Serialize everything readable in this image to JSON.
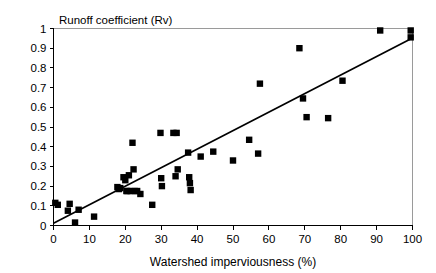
{
  "chart_data": {
    "type": "scatter",
    "title": "",
    "xlabel": "Watershed imperviousness (%)",
    "ylabel": "Runoff coefficient (Rv)",
    "xlim": [
      0,
      100
    ],
    "ylim": [
      0,
      1
    ],
    "xticks": [
      0,
      10,
      20,
      30,
      40,
      50,
      60,
      70,
      80,
      90,
      100
    ],
    "xtick_labels": [
      "0",
      "10",
      "20",
      "30",
      "40",
      "50",
      "60",
      "70",
      "80",
      "90",
      "100"
    ],
    "yticks": [
      0,
      0.1,
      0.2,
      0.3,
      0.4,
      0.5,
      0.6,
      0.7,
      0.8,
      0.9,
      1
    ],
    "ytick_labels": [
      "0",
      "0.1",
      "0.2",
      "0.3",
      "0.4",
      "0.5",
      "0.6",
      "0.7",
      "0.8",
      "0.9",
      "1"
    ],
    "grid": false,
    "legend": null,
    "marker": "square",
    "marker_color": "#000000",
    "points": [
      [
        0.5,
        0.115
      ],
      [
        1.2,
        0.105
      ],
      [
        4.0,
        0.075
      ],
      [
        4.5,
        0.11
      ],
      [
        6.0,
        0.015
      ],
      [
        7.0,
        0.08
      ],
      [
        11.3,
        0.045
      ],
      [
        17.8,
        0.195
      ],
      [
        18.2,
        0.185
      ],
      [
        18.6,
        0.19
      ],
      [
        19.5,
        0.245
      ],
      [
        20.0,
        0.23
      ],
      [
        20.3,
        0.175
      ],
      [
        20.6,
        0.175
      ],
      [
        21.0,
        0.255
      ],
      [
        21.5,
        0.175
      ],
      [
        22.0,
        0.42
      ],
      [
        22.3,
        0.285
      ],
      [
        22.6,
        0.175
      ],
      [
        23.3,
        0.175
      ],
      [
        24.2,
        0.16
      ],
      [
        27.5,
        0.105
      ],
      [
        29.8,
        0.47
      ],
      [
        30.0,
        0.24
      ],
      [
        30.2,
        0.2
      ],
      [
        33.4,
        0.47
      ],
      [
        34.3,
        0.47
      ],
      [
        34.0,
        0.25
      ],
      [
        34.6,
        0.285
      ],
      [
        37.5,
        0.37
      ],
      [
        37.8,
        0.245
      ],
      [
        38.0,
        0.215
      ],
      [
        38.2,
        0.18
      ],
      [
        41.0,
        0.35
      ],
      [
        44.5,
        0.375
      ],
      [
        50.0,
        0.33
      ],
      [
        54.5,
        0.435
      ],
      [
        57.0,
        0.365
      ],
      [
        57.5,
        0.72
      ],
      [
        68.5,
        0.9
      ],
      [
        69.5,
        0.645
      ],
      [
        70.5,
        0.55
      ],
      [
        76.5,
        0.545
      ],
      [
        80.5,
        0.735
      ],
      [
        91.0,
        0.99
      ],
      [
        99.5,
        0.99
      ],
      [
        99.5,
        0.955
      ]
    ],
    "trend_line": {
      "x": [
        0,
        100
      ],
      "y": [
        0.012,
        0.952
      ]
    }
  },
  "axis": {
    "y_title": "Runoff coefficient (Rv)",
    "x_title": "Watershed imperviousness (%)"
  }
}
